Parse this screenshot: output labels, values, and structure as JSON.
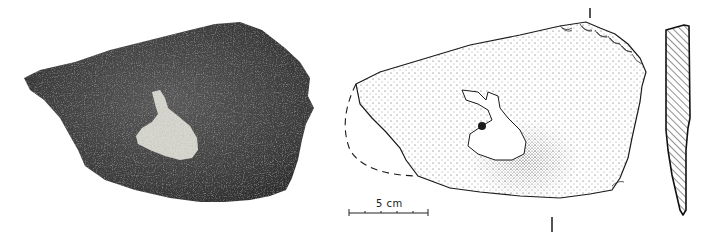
{
  "figure": {
    "panels": [
      {
        "id": "photo",
        "kind": "photograph",
        "subject": "stone-artifact-photo"
      },
      {
        "id": "drawing",
        "kind": "line-drawing",
        "subject": "stone-artifact-stipple-drawing"
      },
      {
        "id": "section",
        "kind": "cross-section",
        "subject": "artifact-profile-hatched"
      }
    ],
    "scale_bar": {
      "label": "5 cm",
      "ticks": 6
    },
    "section_markers": [
      "I",
      "I"
    ],
    "colors": {
      "background": "#ffffff",
      "stone_dark": "#3a3a3a",
      "stone_mid": "#555555",
      "patch_light": "#d8d8d0",
      "ink": "#1a1a1a"
    }
  }
}
